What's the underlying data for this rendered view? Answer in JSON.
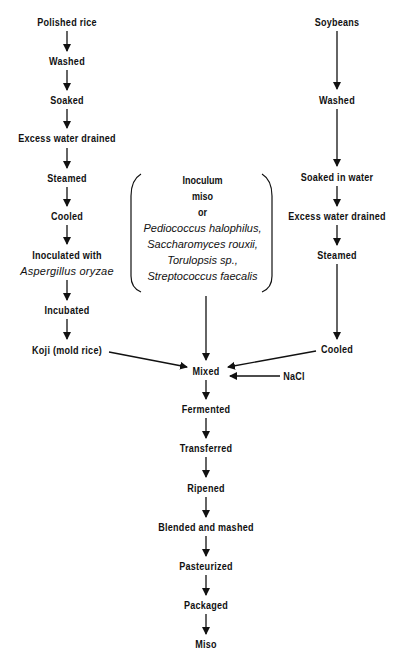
{
  "diagram": {
    "type": "flowchart",
    "title": "",
    "rice_branch": {
      "steps": [
        {
          "label": "Polished rice"
        },
        {
          "label": "Washed"
        },
        {
          "label": "Soaked"
        },
        {
          "label": "Excess water drained"
        },
        {
          "label": "Steamed"
        },
        {
          "label": "Cooled"
        },
        {
          "label": "Inoculated with",
          "label2": "Aspergillus oryzae"
        },
        {
          "label": "Incubated"
        },
        {
          "label": "Koji (mold rice)"
        }
      ]
    },
    "soybean_branch": {
      "steps": [
        {
          "label": "Soybeans"
        },
        {
          "label": "Washed"
        },
        {
          "label": "Soaked in water"
        },
        {
          "label": "Excess water drained"
        },
        {
          "label": "Steamed"
        },
        {
          "label": "Cooled"
        }
      ]
    },
    "inoculum": {
      "line1": "Inoculum",
      "line2": "miso",
      "line3": "or",
      "organisms": [
        "Pediococcus halophilus,",
        "Saccharomyces rouxii,",
        "Torulopsis sp.,",
        "Streptococcus faecalis"
      ]
    },
    "salt": {
      "label": "NaCl"
    },
    "main_line": {
      "steps": [
        {
          "label": "Mixed"
        },
        {
          "label": "Fermented"
        },
        {
          "label": "Transferred"
        },
        {
          "label": "Ripened"
        },
        {
          "label": "Blended and mashed"
        },
        {
          "label": "Pasteurized"
        },
        {
          "label": "Packaged"
        },
        {
          "label": "Miso"
        }
      ]
    },
    "colors": {
      "ink": "#111111",
      "background": "#ffffff"
    }
  }
}
